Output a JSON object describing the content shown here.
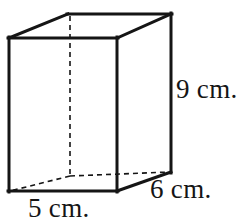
{
  "figure": {
    "name": "rectangular-prism-diagram",
    "type": "3d-rectangular-prism",
    "stroke_color": "#151515",
    "fill_color": "#ffffff",
    "background_color": "#ffffff",
    "solid_edge_width": 3,
    "hidden_edge_width": 1.6,
    "hidden_edge_dash": "5,4",
    "labels": {
      "height": "9 cm.",
      "depth": "6 cm.",
      "width": "5 cm."
    },
    "geometry": {
      "front_top_left": [
        9,
        38
      ],
      "front_top_right": [
        117,
        38
      ],
      "front_bottom_right": [
        117,
        191
      ],
      "front_bottom_left": [
        9,
        191
      ],
      "back_top_left": [
        68,
        14
      ],
      "back_top_right": [
        171,
        14
      ],
      "back_bottom_right": [
        171,
        172
      ],
      "back_bottom_left_hidden": [
        70,
        176
      ]
    }
  }
}
